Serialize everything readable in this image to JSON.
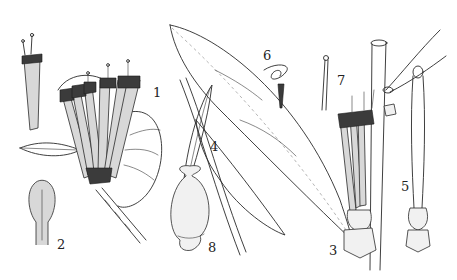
{
  "plate": {
    "subject": "botanical line illustration",
    "ink_color": "#2a2a2a",
    "background_color": "#ffffff",
    "figures": [
      {
        "number": "1",
        "depicts": "flowering branch with clustered tubular flowers and round leaf"
      },
      {
        "number": "2",
        "depicts": "stippled ovary / pistil detail"
      },
      {
        "number": "3",
        "depicts": "stem with lanceolate leaves and flower cluster"
      },
      {
        "number": "4",
        "depicts": "narrow leaf"
      },
      {
        "number": "5",
        "depicts": "single elongated flower with calyx"
      },
      {
        "number": "6",
        "depicts": "coiled stamen"
      },
      {
        "number": "7",
        "depicts": "style with capitate stigma"
      },
      {
        "number": "8",
        "depicts": "fruit / berry"
      }
    ]
  },
  "labels": {
    "fig1": "1",
    "fig2": "2",
    "fig3": "3",
    "fig4": "4",
    "fig5": "5",
    "fig6": "6",
    "fig7": "7",
    "fig8": "8"
  }
}
